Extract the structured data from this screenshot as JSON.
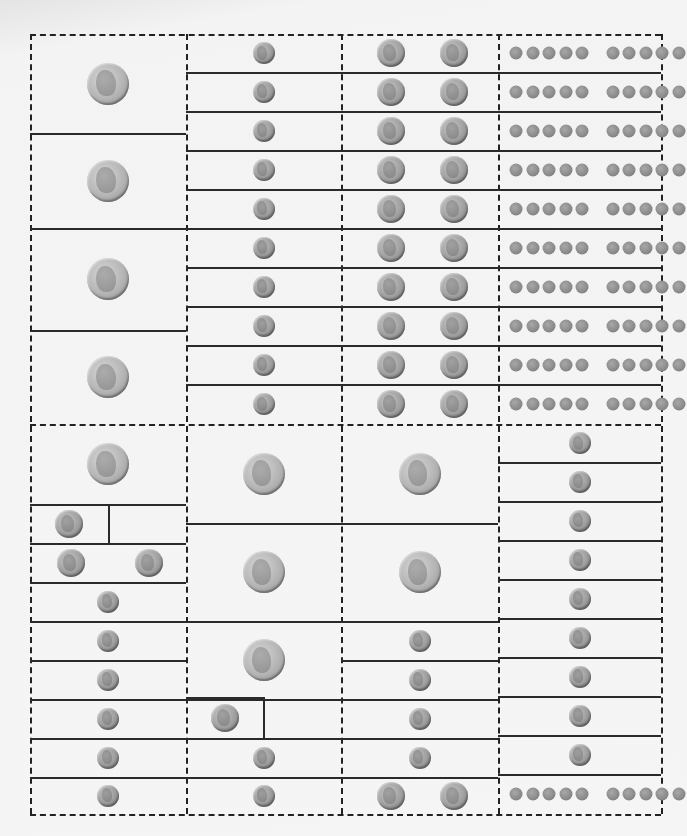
{
  "page": {
    "title": "Coin Dominoes"
  },
  "colors": {
    "line": "#2a2a2a",
    "background": "#f5f5f5",
    "quarter": "#b4b4b4",
    "nickel": "#9e9e9e",
    "dime": "#999999",
    "penny": "#8a8a8a"
  },
  "frame": {
    "left": 30,
    "top": 34,
    "right": 661,
    "bottom": 814,
    "mid_y": 424
  },
  "columns_x": [
    30,
    186,
    341,
    498,
    661
  ],
  "sections": [
    {
      "name": "top",
      "columns": [
        {
          "cells": [
            {
              "y0": 34,
              "y1": 133,
              "coins": [
                "quarter"
              ]
            },
            {
              "y0": 133,
              "y1": 228,
              "coins": [
                "quarter"
              ]
            },
            {
              "y0": 228,
              "y1": 330,
              "coins": [
                "quarter"
              ]
            },
            {
              "y0": 330,
              "y1": 424,
              "coins": [
                "quarter"
              ]
            }
          ]
        },
        {
          "cells": [
            {
              "y0": 34,
              "y1": 72,
              "coins": [
                "dime"
              ]
            },
            {
              "y0": 72,
              "y1": 111,
              "coins": [
                "dime"
              ]
            },
            {
              "y0": 111,
              "y1": 150,
              "coins": [
                "dime"
              ]
            },
            {
              "y0": 150,
              "y1": 189,
              "coins": [
                "dime"
              ]
            },
            {
              "y0": 189,
              "y1": 228,
              "coins": [
                "dime"
              ]
            },
            {
              "y0": 228,
              "y1": 267,
              "coins": [
                "dime"
              ]
            },
            {
              "y0": 267,
              "y1": 306,
              "coins": [
                "dime"
              ]
            },
            {
              "y0": 306,
              "y1": 345,
              "coins": [
                "dime"
              ]
            },
            {
              "y0": 345,
              "y1": 384,
              "coins": [
                "dime"
              ]
            },
            {
              "y0": 384,
              "y1": 424,
              "coins": [
                "dime"
              ]
            }
          ]
        },
        {
          "cells": [
            {
              "y0": 34,
              "y1": 72,
              "coins": [
                "nickel",
                "nickel"
              ]
            },
            {
              "y0": 72,
              "y1": 111,
              "coins": [
                "nickel",
                "nickel"
              ]
            },
            {
              "y0": 111,
              "y1": 150,
              "coins": [
                "nickel",
                "nickel"
              ]
            },
            {
              "y0": 150,
              "y1": 189,
              "coins": [
                "nickel",
                "nickel"
              ]
            },
            {
              "y0": 189,
              "y1": 228,
              "coins": [
                "nickel",
                "nickel"
              ]
            },
            {
              "y0": 228,
              "y1": 267,
              "coins": [
                "nickel",
                "nickel"
              ]
            },
            {
              "y0": 267,
              "y1": 306,
              "coins": [
                "nickel",
                "nickel"
              ]
            },
            {
              "y0": 306,
              "y1": 345,
              "coins": [
                "nickel",
                "nickel"
              ]
            },
            {
              "y0": 345,
              "y1": 384,
              "coins": [
                "nickel",
                "nickel"
              ]
            },
            {
              "y0": 384,
              "y1": 424,
              "coins": [
                "nickel",
                "nickel"
              ]
            }
          ]
        },
        {
          "cells": [
            {
              "y0": 34,
              "y1": 72,
              "coins": [
                "penny-row-10"
              ]
            },
            {
              "y0": 72,
              "y1": 111,
              "coins": [
                "penny-row-10"
              ]
            },
            {
              "y0": 111,
              "y1": 150,
              "coins": [
                "penny-row-10"
              ]
            },
            {
              "y0": 150,
              "y1": 189,
              "coins": [
                "penny-row-10"
              ]
            },
            {
              "y0": 189,
              "y1": 228,
              "coins": [
                "penny-row-10"
              ]
            },
            {
              "y0": 228,
              "y1": 267,
              "coins": [
                "penny-row-10"
              ]
            },
            {
              "y0": 267,
              "y1": 306,
              "coins": [
                "penny-row-10"
              ]
            },
            {
              "y0": 306,
              "y1": 345,
              "coins": [
                "penny-row-10"
              ]
            },
            {
              "y0": 345,
              "y1": 384,
              "coins": [
                "penny-row-10"
              ]
            },
            {
              "y0": 384,
              "y1": 424,
              "coins": [
                "penny-row-10"
              ]
            }
          ]
        }
      ]
    },
    {
      "name": "bottom",
      "columns": [
        {
          "cells": [
            {
              "y0": 424,
              "y1": 504,
              "coins": [
                "quarter"
              ]
            },
            {
              "y0": 504,
              "y1": 543,
              "coins": [
                "nickel"
              ],
              "box_right": 108
            },
            {
              "y0": 543,
              "y1": 582,
              "coins": [
                "nickel",
                "nickel"
              ]
            },
            {
              "y0": 582,
              "y1": 621,
              "coins": [
                "dime"
              ]
            },
            {
              "y0": 621,
              "y1": 660,
              "coins": [
                "dime"
              ]
            },
            {
              "y0": 660,
              "y1": 699,
              "coins": [
                "dime"
              ]
            },
            {
              "y0": 699,
              "y1": 738,
              "coins": [
                "dime"
              ]
            },
            {
              "y0": 738,
              "y1": 777,
              "coins": [
                "dime"
              ]
            },
            {
              "y0": 777,
              "y1": 814,
              "coins": [
                "dime"
              ]
            }
          ]
        },
        {
          "cells": [
            {
              "y0": 424,
              "y1": 523,
              "coins": [
                "quarter"
              ]
            },
            {
              "y0": 523,
              "y1": 621,
              "coins": [
                "quarter"
              ]
            },
            {
              "y0": 621,
              "y1": 699,
              "coins": [
                "quarter"
              ]
            },
            {
              "y0": 697,
              "y1": 738,
              "coins": [
                "nickel"
              ],
              "box_right": 263
            },
            {
              "y0": 738,
              "y1": 777,
              "coins": [
                "dime"
              ]
            },
            {
              "y0": 777,
              "y1": 814,
              "coins": [
                "dime"
              ]
            }
          ]
        },
        {
          "cells": [
            {
              "y0": 424,
              "y1": 523,
              "coins": [
                "quarter"
              ]
            },
            {
              "y0": 523,
              "y1": 621,
              "coins": [
                "quarter"
              ]
            },
            {
              "y0": 621,
              "y1": 660,
              "coins": [
                "dime"
              ]
            },
            {
              "y0": 660,
              "y1": 699,
              "coins": [
                "dime"
              ]
            },
            {
              "y0": 699,
              "y1": 738,
              "coins": [
                "dime"
              ]
            },
            {
              "y0": 738,
              "y1": 777,
              "coins": [
                "dime"
              ]
            },
            {
              "y0": 777,
              "y1": 814,
              "coins": [
                "nickel",
                "nickel"
              ]
            }
          ]
        },
        {
          "cells": [
            {
              "y0": 424,
              "y1": 462,
              "coins": [
                "dime"
              ]
            },
            {
              "y0": 462,
              "y1": 501,
              "coins": [
                "dime"
              ]
            },
            {
              "y0": 501,
              "y1": 540,
              "coins": [
                "dime"
              ]
            },
            {
              "y0": 540,
              "y1": 579,
              "coins": [
                "dime"
              ]
            },
            {
              "y0": 579,
              "y1": 618,
              "coins": [
                "dime"
              ]
            },
            {
              "y0": 618,
              "y1": 657,
              "coins": [
                "dime"
              ]
            },
            {
              "y0": 657,
              "y1": 696,
              "coins": [
                "dime"
              ]
            },
            {
              "y0": 696,
              "y1": 735,
              "coins": [
                "dime"
              ]
            },
            {
              "y0": 735,
              "y1": 774,
              "coins": [
                "dime"
              ]
            },
            {
              "y0": 774,
              "y1": 814,
              "coins": [
                "penny-row-10"
              ]
            }
          ]
        }
      ]
    }
  ],
  "legend": {
    "quarter": "quarter-icon",
    "nickel": "nickel-icon",
    "dime": "dime-icon",
    "penny": "penny-icon"
  }
}
